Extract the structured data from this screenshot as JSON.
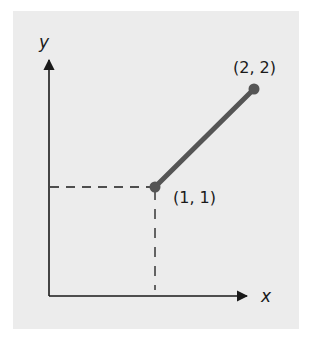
{
  "diagram": {
    "type": "coordinate-plot",
    "axes": {
      "x_label": "x",
      "y_label": "y"
    },
    "points": [
      {
        "label": "(1, 1)",
        "x": 1,
        "y": 1
      },
      {
        "label": "(2, 2)",
        "x": 2,
        "y": 2
      }
    ],
    "segment": {
      "from": "(1, 1)",
      "to": "(2, 2)"
    },
    "guides": "dashed projection lines from (1, 1) to both axes"
  },
  "colors": {
    "background": "#ffffff",
    "panel": "#ececec",
    "axis": "#1a1a1a",
    "segment": "#555555",
    "dashes": "#1a1a1a"
  }
}
